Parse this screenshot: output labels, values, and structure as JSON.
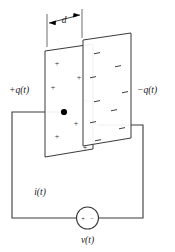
{
  "figure": {
    "labels": {
      "left_charge": "+q(t)",
      "right_charge": "−q(t)",
      "separation": "d",
      "current": "i(t)",
      "voltage": "v(t)"
    },
    "source": {
      "plus": "+",
      "minus": "−"
    },
    "plates": {
      "left": {
        "polarity": "positive",
        "sign_glyph": "+",
        "sign_count": 8,
        "signs": [
          {
            "x": 57,
            "y": 66
          },
          {
            "x": 79,
            "y": 80
          },
          {
            "x": 53,
            "y": 87
          },
          {
            "x": 89,
            "y": 101
          },
          {
            "x": 75,
            "y": 123
          },
          {
            "x": 57,
            "y": 135
          },
          {
            "x": 87,
            "y": 146
          },
          {
            "x": 63,
            "y": 112
          }
        ]
      },
      "right": {
        "polarity": "negative",
        "sign_glyph": "−",
        "sign_count": 9,
        "signs": [
          {
            "x": 97,
            "y": 53
          },
          {
            "x": 118,
            "y": 66
          },
          {
            "x": 93,
            "y": 76
          },
          {
            "x": 126,
            "y": 92
          },
          {
            "x": 97,
            "y": 100
          },
          {
            "x": 114,
            "y": 110
          },
          {
            "x": 93,
            "y": 122
          },
          {
            "x": 122,
            "y": 128
          },
          {
            "x": 98,
            "y": 146
          }
        ]
      }
    },
    "colors": {
      "line": "#3a3a3a",
      "text": "#1a1a1a",
      "background": "#ffffff"
    }
  }
}
